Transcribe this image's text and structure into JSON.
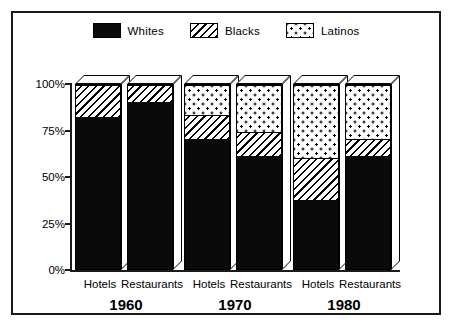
{
  "chart_data": {
    "type": "bar",
    "subtype": "stacked-percentage-3d",
    "title": "",
    "xlabel": "",
    "ylabel": "",
    "ylim": [
      0,
      100
    ],
    "ytick_labels": [
      "0%",
      "25%",
      "50%",
      "75%",
      "100%"
    ],
    "ytick_values": [
      0,
      25,
      50,
      75,
      100
    ],
    "grid": false,
    "legend_position": "top-center",
    "categories": [
      "Hotels",
      "Restaurants",
      "Hotels",
      "Restaurants",
      "Hotels",
      "Restaurants"
    ],
    "groups": [
      "1960",
      "1970",
      "1980"
    ],
    "series": [
      {
        "name": "Whites",
        "pattern": "solid-black",
        "values": [
          83,
          91,
          71,
          62,
          38,
          62
        ]
      },
      {
        "name": "Blacks",
        "pattern": "diagonal-hatch",
        "values": [
          17,
          9,
          13,
          13,
          23,
          9
        ]
      },
      {
        "name": "Latinos",
        "pattern": "dots",
        "values": [
          0,
          0,
          16,
          25,
          39,
          29
        ]
      }
    ],
    "bars": [
      {
        "group": "1960",
        "category": "Hotels",
        "whites": 83,
        "blacks": 17,
        "latinos": 0
      },
      {
        "group": "1960",
        "category": "Restaurants",
        "whites": 91,
        "blacks": 9,
        "latinos": 0
      },
      {
        "group": "1970",
        "category": "Hotels",
        "whites": 71,
        "blacks": 13,
        "latinos": 16
      },
      {
        "group": "1970",
        "category": "Restaurants",
        "whites": 62,
        "blacks": 13,
        "latinos": 25
      },
      {
        "group": "1980",
        "category": "Hotels",
        "whites": 38,
        "blacks": 23,
        "latinos": 39
      },
      {
        "group": "1980",
        "category": "Restaurants",
        "whites": 62,
        "blacks": 9,
        "latinos": 29
      }
    ]
  },
  "legend": {
    "items": [
      {
        "label": "Whites",
        "pattern": "solid-black"
      },
      {
        "label": "Blacks",
        "pattern": "diagonal-hatch"
      },
      {
        "label": "Latinos",
        "pattern": "dots"
      }
    ]
  },
  "colors": {
    "ink": "#000000",
    "border": "#1a1a1a",
    "background": "#ffffff"
  }
}
